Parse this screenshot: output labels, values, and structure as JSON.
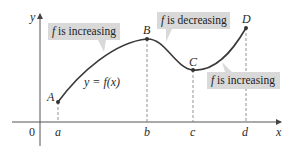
{
  "figure": {
    "axes": {
      "x_label": "x",
      "y_label": "y",
      "origin_label": "0",
      "x_ticks": [
        {
          "label": "a",
          "px": 58
        },
        {
          "label": "b",
          "px": 147
        },
        {
          "label": "c",
          "px": 193
        },
        {
          "label": "d",
          "px": 246
        }
      ]
    },
    "points": [
      {
        "label": "A",
        "px": [
          58,
          102
        ]
      },
      {
        "label": "B",
        "px": [
          147,
          39
        ]
      },
      {
        "label": "C",
        "px": [
          193,
          70
        ]
      },
      {
        "label": "D",
        "px": [
          246,
          28
        ]
      }
    ],
    "curve_label": "y = f(x)",
    "callouts": [
      {
        "text_fn": "f",
        "text_rest": " is increasing",
        "position": "upper-left"
      },
      {
        "text_fn": "f",
        "text_rest": " is decreasing",
        "position": "upper-middle"
      },
      {
        "text_fn": "f",
        "text_rest": " is increasing",
        "position": "lower-right"
      }
    ],
    "colors": {
      "curve": "#3a3a3a",
      "axis": "#555555",
      "callout_fill": "#d9d9d9",
      "dashed": "#777777",
      "text": "#2a2a2a"
    }
  }
}
